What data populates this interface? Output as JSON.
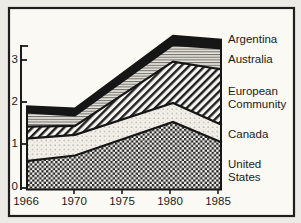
{
  "figure": {
    "type": "stacked-area-chart",
    "background": "#faf9f4",
    "ink_color": "#1b1b1b"
  },
  "legend": {
    "entries": [
      "Argentina",
      "Australia",
      "European Community",
      "Canada",
      "United States"
    ],
    "display_lines": [
      "Argentina",
      "Australia",
      "European",
      "Community",
      "Canada",
      "United",
      "States"
    ]
  },
  "chart_data": {
    "type": "area",
    "stacked": true,
    "title": "",
    "xlabel": "",
    "ylabel": "",
    "x_tick_labels": [
      "1966",
      "1970",
      "1975",
      "1980",
      "1985"
    ],
    "y_tick_labels": [
      "0",
      "1",
      "2",
      "3"
    ],
    "ylim": [
      0,
      3.6
    ],
    "grid": false,
    "legend_position": "right",
    "x": [
      1966,
      1970,
      1980,
      1985
    ],
    "series": [
      {
        "name": "United States",
        "pattern": "checkerboard",
        "values": [
          0.65,
          0.78,
          1.56,
          1.08
        ],
        "cumulative": [
          0.65,
          0.78,
          1.56,
          1.08
        ]
      },
      {
        "name": "Canada",
        "pattern": "dots",
        "values": [
          0.52,
          0.48,
          0.44,
          0.41
        ],
        "cumulative": [
          1.17,
          1.26,
          2.0,
          1.49
        ]
      },
      {
        "name": "European Community",
        "pattern": "diagonal-hatch",
        "values": [
          0.28,
          0.21,
          0.96,
          1.29
        ],
        "cumulative": [
          1.45,
          1.47,
          2.96,
          2.78
        ]
      },
      {
        "name": "Australia",
        "pattern": "horizontal-lines",
        "values": [
          0.33,
          0.24,
          0.39,
          0.49
        ],
        "cumulative": [
          1.78,
          1.71,
          3.35,
          3.27
        ]
      },
      {
        "name": "Argentina",
        "pattern": "solid-black",
        "values": [
          0.14,
          0.16,
          0.21,
          0.2
        ],
        "cumulative": [
          1.92,
          1.87,
          3.56,
          3.47
        ]
      }
    ]
  }
}
